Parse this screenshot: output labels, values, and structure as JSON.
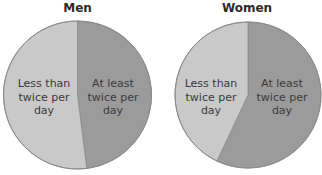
{
  "chart_data": [
    {
      "type": "pie",
      "title": "Men",
      "categories": [
        "At least twice per day",
        "Less than twice per day"
      ],
      "values": [
        48,
        52
      ],
      "colors": [
        "#9b9b9b",
        "#c9c9c9"
      ],
      "start_angle_deg": 0,
      "direction": "clockwise",
      "legend": "none (labels inside slices)"
    },
    {
      "type": "pie",
      "title": "Women",
      "categories": [
        "At least twice per day",
        "Less than twice per day"
      ],
      "values": [
        57,
        43
      ],
      "colors": [
        "#9b9b9b",
        "#c9c9c9"
      ],
      "start_angle_deg": 0,
      "direction": "clockwise",
      "legend": "none (labels inside slices)"
    }
  ],
  "men": {
    "title": "Men",
    "label_dark_l1": "At least",
    "label_dark_l2": "twice per",
    "label_dark_l3": "day",
    "label_light_l1": "Less than",
    "label_light_l2": "twice per",
    "label_light_l3": "day"
  },
  "women": {
    "title": "Women",
    "label_dark_l1": "At least",
    "label_dark_l2": "twice per",
    "label_dark_l3": "day",
    "label_light_l1": "Less than",
    "label_light_l2": "twice per",
    "label_light_l3": "day"
  }
}
